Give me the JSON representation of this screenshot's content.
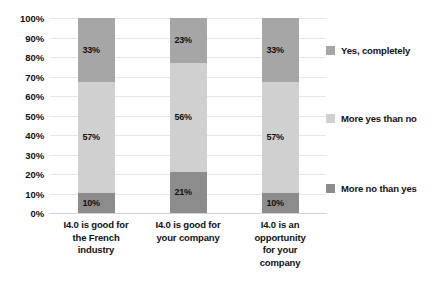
{
  "chart_data": {
    "type": "bar",
    "subtype": "stacked-percent",
    "title": "",
    "xlabel": "",
    "ylabel": "",
    "ylim": [
      0,
      100
    ],
    "grid": true,
    "legend_position": "right",
    "categories": [
      "I4.0 is good for the French industry",
      "I4.0 is good for your company",
      "I4.0 is an opportunity for your company"
    ],
    "category_lines": [
      [
        "I4.0 is good for",
        "the French",
        "industry"
      ],
      [
        "I4.0 is good for",
        "your company"
      ],
      [
        "I4.0 is an",
        "opportunity",
        "for your",
        "company"
      ]
    ],
    "ytick_labels": [
      "100%",
      "90%",
      "80%",
      "70%",
      "60%",
      "50%",
      "40%",
      "30%",
      "20%",
      "10%",
      "0%"
    ],
    "ytick_values": [
      100,
      90,
      80,
      70,
      60,
      50,
      40,
      30,
      20,
      10,
      0
    ],
    "series": [
      {
        "name": "Yes, completely",
        "color": "#a6a6a6",
        "values": [
          33,
          23,
          33
        ],
        "labels": [
          "33%",
          "23%",
          "33%"
        ]
      },
      {
        "name": "More yes than no",
        "color": "#d0d0d0",
        "values": [
          57,
          56,
          57
        ],
        "labels": [
          "57%",
          "56%",
          "57%"
        ]
      },
      {
        "name": "More no than yes",
        "color": "#8c8c8c",
        "values": [
          10,
          21,
          10
        ],
        "labels": [
          "10%",
          "21%",
          "10%"
        ]
      }
    ],
    "legend": [
      {
        "label": "Yes, completely",
        "color": "#a6a6a6"
      },
      {
        "label": "More yes than no",
        "color": "#d0d0d0"
      },
      {
        "label": "More no than yes",
        "color": "#8c8c8c"
      }
    ],
    "colors": {
      "gridline": "#e6e6e6",
      "baseline": "#d2d2d2",
      "text": "#111111",
      "background": "#ffffff"
    }
  }
}
